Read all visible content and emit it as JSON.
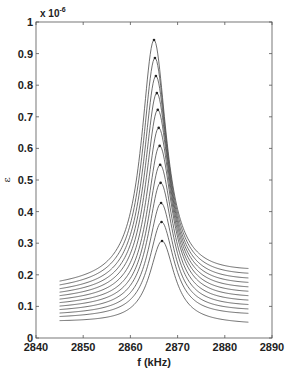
{
  "chart_data": {
    "type": "line",
    "title": "",
    "xlabel": "f (kHz)",
    "ylabel": "ε",
    "y_multiplier": "x 10",
    "y_exponent": "-6",
    "xlim": [
      2840,
      2890
    ],
    "ylim": [
      0,
      1
    ],
    "x_ticks": [
      "2840",
      "2850",
      "2860",
      "2870",
      "2880",
      "2890"
    ],
    "y_ticks": [
      "0",
      "0.1",
      "0.2",
      "0.3",
      "0.4",
      "0.5",
      "0.6",
      "0.7",
      "0.8",
      "0.9",
      "1"
    ],
    "grid": false,
    "legend": null,
    "line_color": "#4a4a4a",
    "x_range_of_series": [
      2845,
      2885
    ],
    "series": [
      {
        "name": "curve 1",
        "peak_f": 2865.0,
        "peak": 0.943,
        "left": 0.18,
        "right": 0.22
      },
      {
        "name": "curve 2",
        "peak_f": 2865.2,
        "peak": 0.886,
        "left": 0.168,
        "right": 0.205
      },
      {
        "name": "curve 3",
        "peak_f": 2865.4,
        "peak": 0.829,
        "left": 0.156,
        "right": 0.19
      },
      {
        "name": "curve 4",
        "peak_f": 2865.6,
        "peak": 0.775,
        "left": 0.145,
        "right": 0.176
      },
      {
        "name": "curve 5",
        "peak_f": 2865.8,
        "peak": 0.722,
        "left": 0.134,
        "right": 0.162
      },
      {
        "name": "curve 6",
        "peak_f": 2866.0,
        "peak": 0.665,
        "left": 0.123,
        "right": 0.148
      },
      {
        "name": "curve 7",
        "peak_f": 2866.2,
        "peak": 0.608,
        "left": 0.112,
        "right": 0.134
      },
      {
        "name": "curve 8",
        "peak_f": 2866.3,
        "peak": 0.548,
        "left": 0.101,
        "right": 0.12
      },
      {
        "name": "curve 9",
        "peak_f": 2866.4,
        "peak": 0.491,
        "left": 0.09,
        "right": 0.106
      },
      {
        "name": "curve 10",
        "peak_f": 2866.5,
        "peak": 0.427,
        "left": 0.079,
        "right": 0.092
      },
      {
        "name": "curve 11",
        "peak_f": 2866.6,
        "peak": 0.367,
        "left": 0.068,
        "right": 0.078
      },
      {
        "name": "curve 12",
        "peak_f": 2866.7,
        "peak": 0.307,
        "left": 0.055,
        "right": 0.05
      }
    ]
  }
}
